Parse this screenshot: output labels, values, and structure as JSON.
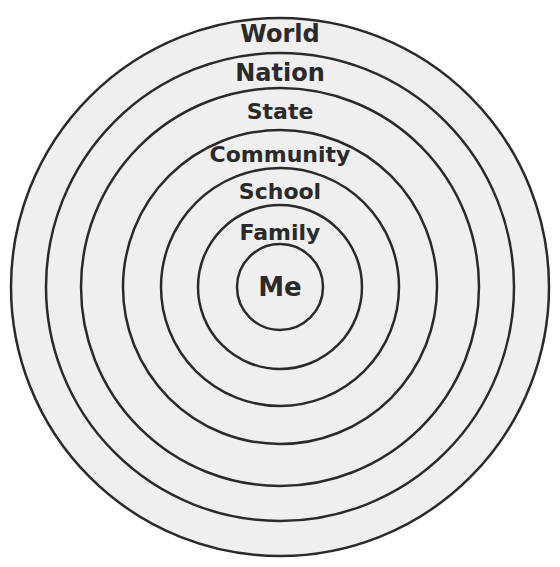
{
  "diagram": {
    "type": "concentric-circles",
    "center": {
      "x": 280,
      "y": 287
    },
    "fill_color": "#efefef",
    "stroke_color": "#2a2a2a",
    "rings": [
      {
        "label": "World",
        "radius": 269,
        "label_y": 42,
        "font_size": 24
      },
      {
        "label": "Nation",
        "radius": 234,
        "label_y": 81,
        "font_size": 24
      },
      {
        "label": "State",
        "radius": 199,
        "label_y": 119,
        "font_size": 22
      },
      {
        "label": "Community",
        "radius": 157,
        "label_y": 162,
        "font_size": 22
      },
      {
        "label": "School",
        "radius": 119,
        "label_y": 199,
        "font_size": 22
      },
      {
        "label": "Family",
        "radius": 82,
        "label_y": 240,
        "font_size": 22
      },
      {
        "label": "Me",
        "radius": 43,
        "label_y": 296,
        "font_size": 26
      }
    ]
  }
}
